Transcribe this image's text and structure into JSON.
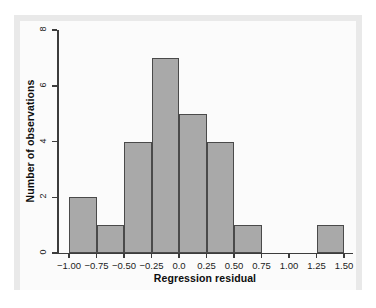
{
  "chart_data": {
    "type": "bar",
    "title": "",
    "subtitle": "",
    "xlabel": "Regression residual",
    "ylabel": "Number of observations",
    "grid": false,
    "legend": null,
    "legend_position": "none",
    "xlim": [
      -1.0,
      1.5
    ],
    "ylim": [
      0,
      8
    ],
    "bin_width": 0.25,
    "xticks": [
      -1.0,
      -0.75,
      -0.5,
      -0.25,
      0.0,
      0.25,
      0.5,
      0.75,
      1.0,
      1.25,
      1.5
    ],
    "xtick_labels": [
      "−1.00",
      "−0.75",
      "−0.50",
      "−0.25",
      "0.0",
      "0.25",
      "0.50",
      "0.75",
      "1.00",
      "1.25",
      "1.50"
    ],
    "yticks": [
      0,
      2,
      4,
      6,
      8
    ],
    "ytick_labels": [
      "0",
      "2",
      "4",
      "6",
      "8"
    ],
    "bin_edges": [
      -1.0,
      -0.75,
      -0.5,
      -0.25,
      0.0,
      0.25,
      0.5,
      0.75,
      1.0,
      1.25,
      1.5
    ],
    "categories": [
      "−1.00 to −0.75",
      "−0.75 to −0.50",
      "−0.50 to −0.25",
      "−0.25 to 0.00",
      "0.00 to 0.25",
      "0.25 to 0.50",
      "0.50 to 0.75",
      "0.75 to 1.00",
      "1.00 to 1.25",
      "1.25 to 1.50"
    ],
    "values": [
      2,
      1,
      4,
      7,
      5,
      4,
      1,
      0,
      0,
      1
    ],
    "bars": [
      {
        "x0": -1.0,
        "x1": -0.75,
        "value": 2
      },
      {
        "x0": -0.75,
        "x1": -0.5,
        "value": 1
      },
      {
        "x0": -0.5,
        "x1": -0.25,
        "value": 4
      },
      {
        "x0": -0.25,
        "x1": 0.0,
        "value": 7
      },
      {
        "x0": 0.0,
        "x1": 0.25,
        "value": 5
      },
      {
        "x0": 0.25,
        "x1": 0.5,
        "value": 4
      },
      {
        "x0": 0.5,
        "x1": 0.75,
        "value": 1
      },
      {
        "x0": 0.75,
        "x1": 1.0,
        "value": 0
      },
      {
        "x0": 1.0,
        "x1": 1.25,
        "value": 0
      },
      {
        "x0": 1.25,
        "x1": 1.5,
        "value": 1
      }
    ],
    "colors": {
      "bar_fill": "#a9a9a9",
      "bar_edge": "#4a4a4a",
      "axis": "#3c3c3c",
      "text": "#0d0d0d",
      "plot_background": "#fbfbfb",
      "figure_background": "#e9e9e9"
    }
  }
}
